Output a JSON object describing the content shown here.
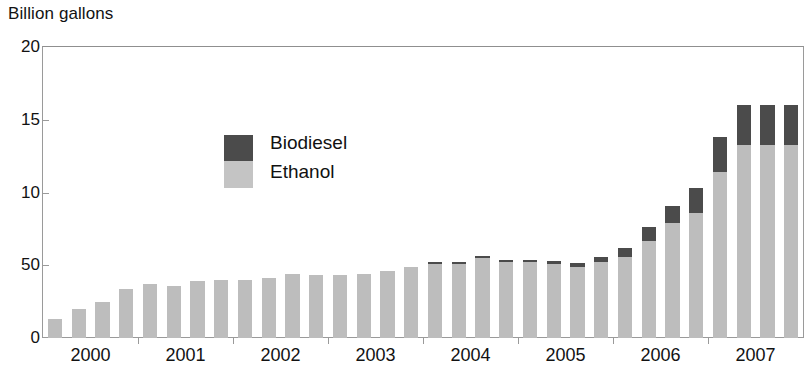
{
  "axis_title": "Billion gallons",
  "legend": {
    "series": [
      {
        "key": "biodiesel",
        "label": "Biodiesel",
        "color": "#4b4b4b"
      },
      {
        "key": "ethanol",
        "label": "Ethanol",
        "color": "#bdbdbd"
      }
    ]
  },
  "colors": {
    "ethanol": "#bdbdbd",
    "biodiesel": "#4b4b4b",
    "axis": "#9a9a9a",
    "text": "#121212",
    "background": "#ffffff"
  },
  "chart_data": {
    "type": "bar",
    "stacked": true,
    "title": "",
    "subtitle": "",
    "xlabel": "",
    "ylabel": "Billion gallons",
    "ylim": [
      0,
      20
    ],
    "yticks": [
      0,
      5,
      10,
      15,
      20
    ],
    "ytick_labels": [
      "0",
      "50",
      "10",
      "15",
      "20"
    ],
    "grid": false,
    "legend_position": "inside-upper-left",
    "xtick_labels": [
      "2000",
      "2001",
      "2002",
      "2003",
      "2004",
      "2005",
      "2006",
      "2007"
    ],
    "x_group_size": 4,
    "x_period": "quarter",
    "categories": [
      "2000 Q1",
      "2000 Q2",
      "2000 Q3",
      "2000 Q4",
      "2001 Q1",
      "2001 Q2",
      "2001 Q3",
      "2001 Q4",
      "2002 Q1",
      "2002 Q2",
      "2002 Q3",
      "2002 Q4",
      "2003 Q1",
      "2003 Q2",
      "2003 Q3",
      "2003 Q4",
      "2004 Q1",
      "2004 Q2",
      "2004 Q3",
      "2004 Q4",
      "2005 Q1",
      "2005 Q2",
      "2005 Q3",
      "2005 Q4",
      "2006 Q1",
      "2006 Q2",
      "2006 Q3",
      "2006 Q4",
      "2007 Q1",
      "2007 Q2",
      "2007 Q3",
      "2007 Q4"
    ],
    "series": [
      {
        "name": "Ethanol",
        "color": "#bdbdbd",
        "values": [
          1.3,
          2.0,
          2.5,
          3.4,
          3.7,
          3.6,
          3.9,
          4.0,
          4.0,
          4.1,
          4.4,
          4.3,
          4.3,
          4.4,
          4.6,
          4.9,
          5.1,
          5.1,
          5.5,
          5.2,
          5.2,
          5.1,
          4.9,
          5.2,
          5.6,
          6.7,
          7.9,
          8.6,
          11.4,
          13.3,
          13.3,
          13.3
        ]
      },
      {
        "name": "Biodiesel",
        "color": "#4b4b4b",
        "values": [
          0.0,
          0.0,
          0.0,
          0.0,
          0.0,
          0.0,
          0.0,
          0.0,
          0.0,
          0.0,
          0.0,
          0.0,
          0.0,
          0.0,
          0.0,
          0.0,
          0.05,
          0.1,
          0.15,
          0.15,
          0.15,
          0.2,
          0.25,
          0.4,
          0.6,
          0.9,
          1.2,
          1.7,
          2.4,
          2.7,
          2.7,
          2.7
        ]
      }
    ],
    "totals": [
      1.3,
      2.0,
      2.5,
      3.4,
      3.7,
      3.6,
      3.9,
      4.0,
      4.0,
      4.1,
      4.4,
      4.3,
      4.3,
      4.4,
      4.6,
      4.9,
      5.15,
      5.2,
      5.65,
      5.35,
      5.35,
      5.3,
      5.15,
      5.6,
      6.2,
      7.6,
      9.1,
      10.3,
      13.8,
      16.0,
      16.0,
      16.0
    ],
    "visible_bar_count": 29
  }
}
